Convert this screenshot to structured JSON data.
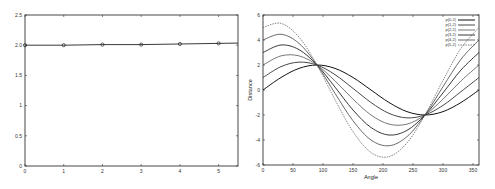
{
  "chart_data": [
    {
      "type": "line",
      "title": "",
      "xlabel": "",
      "ylabel": "",
      "x": [
        0,
        1,
        2,
        3,
        4,
        5
      ],
      "series": [
        {
          "name": "",
          "values": [
            2.0,
            2.0,
            2.01,
            2.01,
            2.02,
            2.03
          ],
          "marker": "circle"
        }
      ],
      "xlim": [
        0,
        5.5
      ],
      "ylim": [
        0,
        2.5
      ],
      "xticks": [
        "0",
        "1",
        "2",
        "3",
        "4",
        "5"
      ],
      "yticks": [
        "0",
        "0.5",
        "1",
        "1.5",
        "2.0",
        "2.5"
      ],
      "grid": false,
      "legend": null
    },
    {
      "type": "line",
      "title": "",
      "xlabel": "Angle",
      "ylabel": "Distance",
      "xlim": [
        0,
        360
      ],
      "ylim": [
        -6,
        6
      ],
      "xticks": [
        "0",
        "50",
        "100",
        "150",
        "200",
        "250",
        "300",
        "350"
      ],
      "yticks": [
        "-6",
        "-4",
        "-2",
        "0",
        "2",
        "4",
        "6"
      ],
      "grid": false,
      "legend_position": "upper right",
      "x": [
        0,
        30,
        60,
        90,
        120,
        150,
        180,
        210,
        240,
        270,
        300,
        330,
        360
      ],
      "series": [
        {
          "name": "p(0,2)",
          "values": [
            0.0,
            1.0,
            1.73,
            2.0,
            1.73,
            1.0,
            0.0,
            -1.0,
            -1.73,
            -2.0,
            -1.73,
            -1.0,
            0.0
          ]
        },
        {
          "name": "p(1,2)",
          "values": [
            1.0,
            1.87,
            2.23,
            2.0,
            1.23,
            0.13,
            -1.0,
            -1.87,
            -2.23,
            -2.0,
            -1.23,
            -0.13,
            1.0
          ]
        },
        {
          "name": "p(2,2)",
          "values": [
            2.0,
            2.73,
            2.73,
            2.0,
            0.73,
            -0.73,
            -2.0,
            -2.73,
            -2.73,
            -2.0,
            -0.73,
            0.73,
            2.0
          ]
        },
        {
          "name": "p(3,2)",
          "values": [
            3.0,
            3.6,
            3.23,
            2.0,
            0.23,
            -1.6,
            -3.0,
            -3.6,
            -3.23,
            -2.0,
            -0.23,
            1.6,
            3.0
          ]
        },
        {
          "name": "p(4,2)",
          "values": [
            4.0,
            4.46,
            3.73,
            2.0,
            -0.27,
            -2.46,
            -4.0,
            -4.46,
            -3.73,
            -2.0,
            0.27,
            2.46,
            4.0
          ]
        },
        {
          "name": "p(5,2)",
          "values": [
            5.0,
            5.33,
            4.23,
            2.0,
            -0.77,
            -3.33,
            -5.0,
            -5.33,
            -4.23,
            -2.0,
            0.77,
            3.33,
            5.0
          ]
        }
      ]
    }
  ]
}
